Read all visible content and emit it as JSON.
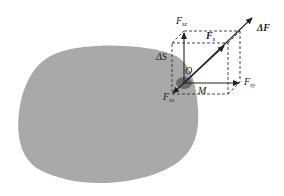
{
  "diagram": {
    "type": "stress-at-a-point",
    "body": {
      "fill": "#a9a9a9"
    },
    "point_patch": {
      "fill": "#666666"
    },
    "labels": {
      "delta_f": {
        "base": "ΔF",
        "sub": ""
      },
      "f_s": {
        "base": "F",
        "sub": "s"
      },
      "f_sz": {
        "base": "F",
        "sub": "sz"
      },
      "f_sy": {
        "base": "F",
        "sub": "sy"
      },
      "f_sx": {
        "base": "F",
        "sub": "sx"
      },
      "delta_s": {
        "base": "ΔS",
        "sub": ""
      },
      "origin": {
        "base": "O",
        "sub": ""
      },
      "point_m": {
        "base": "M",
        "sub": ""
      }
    },
    "colors": {
      "line": "#222222",
      "dashed": "#333333"
    }
  }
}
